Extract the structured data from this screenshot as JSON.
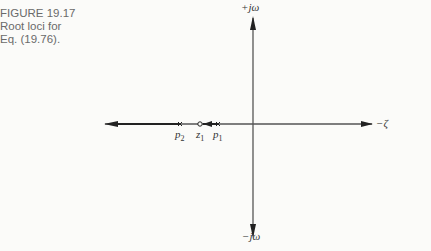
{
  "caption": {
    "line1": "FIGURE 19.17",
    "line2": "Root loci for",
    "line3": "Eq. (19.76)."
  },
  "axes": {
    "positive_imag_label": "+jω",
    "negative_imag_label": "−jω",
    "real_label": "−ζ"
  },
  "points": {
    "p2": {
      "base": "p",
      "sub": "2",
      "marker": "x"
    },
    "z1": {
      "base": "z",
      "sub": "1",
      "marker": "o"
    },
    "p1": {
      "base": "p",
      "sub": "1",
      "marker": "x"
    }
  },
  "colors": {
    "line": "#444444",
    "text": "#333333",
    "caption": "#6a6a6a"
  }
}
